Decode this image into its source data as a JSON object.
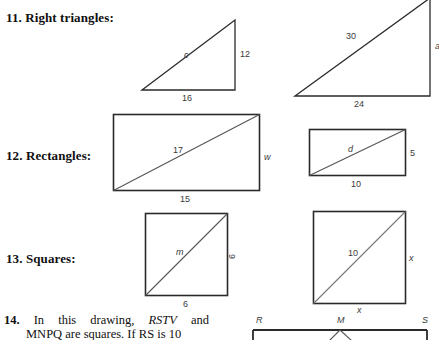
{
  "problems": [
    {
      "number": "11.",
      "text": "Right triangles:"
    },
    {
      "number": "12.",
      "text": "Rectangles:"
    },
    {
      "number": "13.",
      "text": "Squares:"
    }
  ],
  "figures": {
    "triangle_left": {
      "hypotenuse": "c",
      "vertical": "12",
      "base": "16"
    },
    "triangle_right": {
      "hypotenuse": "30",
      "vertical": "a",
      "base": "24"
    },
    "rectangle_left": {
      "diagonal": "17",
      "side": "w",
      "base": "15"
    },
    "rectangle_right": {
      "diagonal": "d",
      "side": "5",
      "base": "10"
    },
    "square_left": {
      "diagonal": "m",
      "side": "6",
      "base": "6"
    },
    "square_right": {
      "diagonal": "10",
      "side": "x",
      "base": "x"
    },
    "bottom_drawing": {
      "vertex_r": "R",
      "vertex_m": "M",
      "vertex_s": "S"
    }
  },
  "question14": {
    "number": "14.",
    "line1_a": "In",
    "line1_b": "this",
    "line1_c": "drawing,",
    "line1_d": "RSTV",
    "line1_e": "and",
    "line2": "MNPQ are squares. If RS is 10"
  },
  "colors": {
    "ink": "#101010",
    "figure_stroke": "#2a2a2a",
    "dim_text": "#3a3a3a",
    "page_background": "#ffffff"
  }
}
